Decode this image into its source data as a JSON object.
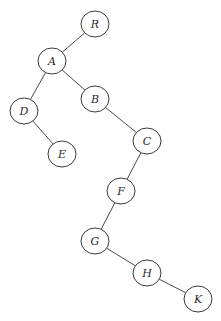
{
  "diagram": {
    "type": "binary-tree",
    "nodes": [
      {
        "id": "R",
        "label": "R",
        "x": 95,
        "y": 24
      },
      {
        "id": "A",
        "label": "A",
        "x": 52,
        "y": 61
      },
      {
        "id": "B",
        "label": "B",
        "x": 95,
        "y": 99
      },
      {
        "id": "D",
        "label": "D",
        "x": 24,
        "y": 111
      },
      {
        "id": "C",
        "label": "C",
        "x": 147,
        "y": 141
      },
      {
        "id": "E",
        "label": "E",
        "x": 62,
        "y": 154
      },
      {
        "id": "F",
        "label": "F",
        "x": 121,
        "y": 191
      },
      {
        "id": "G",
        "label": "G",
        "x": 95,
        "y": 241
      },
      {
        "id": "H",
        "label": "H",
        "x": 147,
        "y": 273
      },
      {
        "id": "K",
        "label": "K",
        "x": 198,
        "y": 299
      }
    ],
    "edges": [
      {
        "from": "R",
        "to": "A"
      },
      {
        "from": "A",
        "to": "D"
      },
      {
        "from": "A",
        "to": "B"
      },
      {
        "from": "D",
        "to": "E"
      },
      {
        "from": "B",
        "to": "C"
      },
      {
        "from": "C",
        "to": "F"
      },
      {
        "from": "F",
        "to": "G"
      },
      {
        "from": "G",
        "to": "H"
      },
      {
        "from": "H",
        "to": "K"
      }
    ]
  }
}
